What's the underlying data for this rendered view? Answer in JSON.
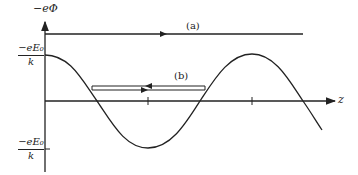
{
  "figure": {
    "y_axis_label": "−eΦ",
    "x_axis_label": "z",
    "upper_level_label": {
      "numerator": "−eE₀",
      "denominator": "k"
    },
    "lower_level_label": {
      "numerator": "−eE₀",
      "denominator": "k"
    },
    "trajectories": [
      {
        "id": "a",
        "label": "(a)",
        "description": "unbounded trajectory above potential maximum, arrow pointing right"
      },
      {
        "id": "b",
        "label": "(b)",
        "description": "bounded oscillation within potential well, arrows in both directions"
      }
    ],
    "curve": "cosine potential: -eΦ = (-eE₀/k) cos(kz)",
    "colors": {
      "ink": "#222222",
      "background": "#ffffff"
    }
  }
}
